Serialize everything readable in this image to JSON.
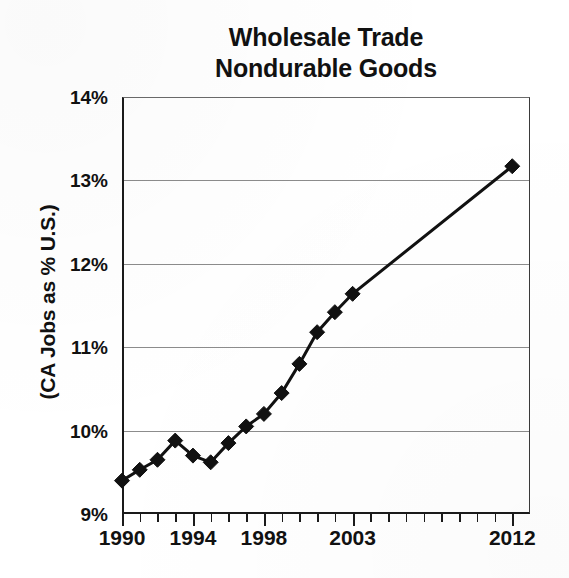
{
  "chart_data": {
    "type": "line",
    "title": "Wholesale Trade Nondurable Goods",
    "title_lines": [
      "Wholesale Trade",
      "Nondurable Goods"
    ],
    "xlabel": "",
    "ylabel": "(CA Jobs as % U.S.)",
    "xlim": [
      1990,
      2013
    ],
    "ylim": [
      9,
      14
    ],
    "ytick_values": [
      14,
      13,
      12,
      11,
      10,
      9
    ],
    "ytick_labels": [
      "14%",
      "13%",
      "12%",
      "11%",
      "10%",
      "9%"
    ],
    "xtick_labels": [
      "1990",
      "1994",
      "1998",
      "2003",
      "2012"
    ],
    "xtick_values": [
      1990,
      1994,
      1998,
      2003,
      2012
    ],
    "grid": true,
    "grid_axis": "y",
    "legend": "none",
    "marker": "diamond",
    "line_color": "#111111",
    "marker_color": "#111111",
    "x": [
      1990,
      1991,
      1992,
      1993,
      1994,
      1995,
      1996,
      1997,
      1998,
      1999,
      2000,
      2001,
      2002,
      2003,
      2012
    ],
    "values": [
      9.4,
      9.53,
      9.65,
      9.88,
      9.7,
      9.62,
      9.85,
      10.05,
      10.2,
      10.45,
      10.8,
      11.18,
      11.42,
      11.64,
      13.17
    ],
    "series": [
      {
        "name": "CA Jobs as % U.S.",
        "values": [
          9.4,
          9.53,
          9.65,
          9.88,
          9.7,
          9.62,
          9.85,
          10.05,
          10.2,
          10.45,
          10.8,
          11.18,
          11.42,
          11.64,
          13.17
        ]
      }
    ],
    "x_axis_minor_ticks": [
      1990,
      1991,
      1992,
      1993,
      1994,
      1995,
      1996,
      1997,
      1998,
      1999,
      2000,
      2001,
      2002,
      2003,
      2004,
      2005,
      2006,
      2007,
      2008,
      2009,
      2010,
      2011,
      2012
    ]
  }
}
